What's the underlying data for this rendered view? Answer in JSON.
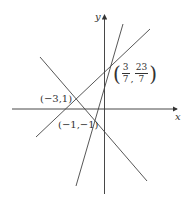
{
  "diagram": {
    "type": "coordinate-plane-lines",
    "axes": {
      "x_label": "x",
      "y_label": "y",
      "color": "#333333"
    },
    "line_color": "#444444",
    "lines": [
      {
        "id": "line-1",
        "through": [
          "(-3,1)",
          "(-1,-1)"
        ]
      },
      {
        "id": "line-2",
        "through": [
          "(-3,1)",
          "(3/7,23/7)"
        ]
      },
      {
        "id": "line-3",
        "through": [
          "(-1,-1)",
          "(3/7,23/7)"
        ]
      }
    ],
    "points": [
      {
        "label": "(−3,1)"
      },
      {
        "label": "(−1,−1)"
      },
      {
        "label_open": "(",
        "x_num": "3",
        "x_den": "7",
        "sep": ",",
        "y_num": "23",
        "y_den": "7",
        "label_close": ")"
      }
    ]
  }
}
